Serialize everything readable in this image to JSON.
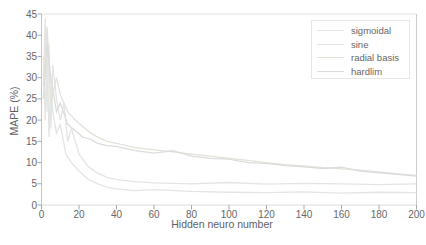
{
  "chart_data": {
    "type": "line",
    "title": "",
    "xlabel": "Hidden neuro number",
    "ylabel": "MAPE (%)",
    "xlim": [
      0,
      200
    ],
    "ylim": [
      0,
      45
    ],
    "xticks": [
      0,
      20,
      40,
      60,
      80,
      100,
      120,
      140,
      160,
      180,
      200
    ],
    "yticks": [
      0,
      5,
      10,
      15,
      20,
      25,
      30,
      35,
      40,
      45
    ],
    "grid": false,
    "legend_position": "top-right",
    "series": [
      {
        "name": "sigmoidal",
        "color": "#e4e4e4",
        "x": [
          1,
          2,
          3,
          4,
          5,
          6,
          8,
          10,
          12,
          14,
          16,
          20,
          25,
          30,
          35,
          40,
          50,
          60,
          80,
          100,
          120,
          140,
          160,
          180,
          200
        ],
        "y": [
          30,
          44,
          22,
          38,
          18,
          33,
          25,
          20,
          24,
          15,
          18,
          12,
          9,
          7.5,
          6.5,
          6,
          5.5,
          5.2,
          5,
          5.3,
          4.9,
          5.1,
          5,
          4.8,
          5
        ]
      },
      {
        "name": "sine",
        "color": "#e2e6e2",
        "x": [
          1,
          2,
          3,
          4,
          5,
          6,
          8,
          10,
          13,
          16,
          20,
          25,
          30,
          35,
          40,
          50,
          60,
          80,
          100,
          120,
          140,
          160,
          180,
          200
        ],
        "y": [
          35,
          20,
          40,
          16,
          28,
          22,
          17,
          19,
          12,
          10,
          8,
          6,
          5,
          4.2,
          3.8,
          3.4,
          3.6,
          3.2,
          3,
          2.9,
          3.1,
          2.8,
          3,
          2.9
        ]
      },
      {
        "name": "radial basis",
        "color": "#e3e2d9",
        "x": [
          1,
          3,
          5,
          8,
          10,
          14,
          18,
          22,
          26,
          30,
          35,
          40,
          50,
          60,
          70,
          80,
          90,
          100,
          110,
          120,
          130,
          140,
          150,
          160,
          170,
          180,
          190,
          200
        ],
        "y": [
          28,
          42,
          24,
          30,
          26,
          22,
          20,
          18.5,
          17,
          16,
          15,
          14.5,
          13.5,
          13,
          12.5,
          12,
          11.5,
          11,
          10.5,
          10,
          9.5,
          9.2,
          8.8,
          8.5,
          8.2,
          7.8,
          7.3,
          7
        ]
      },
      {
        "name": "hardlim",
        "color": "#dcdcdc",
        "x": [
          1,
          3,
          5,
          8,
          10,
          14,
          18,
          22,
          26,
          30,
          35,
          40,
          50,
          60,
          70,
          80,
          90,
          100,
          110,
          120,
          130,
          140,
          150,
          160,
          170,
          180,
          190,
          200
        ],
        "y": [
          25,
          38,
          30,
          22,
          24,
          19,
          17.5,
          16,
          15.5,
          14.5,
          14,
          13.8,
          12.8,
          12.2,
          12.8,
          11.5,
          11,
          10.8,
          10,
          9.8,
          9.3,
          9,
          8.6,
          8.9,
          8,
          7.6,
          7.2,
          6.8
        ]
      }
    ]
  },
  "colors": {
    "background": "#ffffff",
    "axis_left": "#c6c6c6",
    "axis_bottom": "#dcdcdc",
    "axis_top": "#e2e2e2",
    "axis_right": "#cccccc",
    "tick_mark": "#a8a8a8",
    "text": "#676767",
    "legend_border": "#e7e7e7"
  }
}
